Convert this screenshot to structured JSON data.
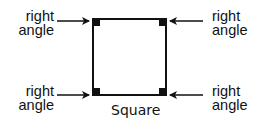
{
  "diagram": {
    "shape": "square",
    "caption": "Square",
    "square": {
      "x1": 93,
      "y1": 19,
      "x2": 166,
      "y2": 95
    },
    "stroke_color": "#111111",
    "labels": {
      "top_left": {
        "line1": "right",
        "line2": "angle"
      },
      "top_right": {
        "line1": "right",
        "line2": "angle"
      },
      "bottom_left": {
        "line1": "right",
        "line2": "angle"
      },
      "bottom_right": {
        "line1": "right",
        "line2": "angle"
      }
    }
  }
}
